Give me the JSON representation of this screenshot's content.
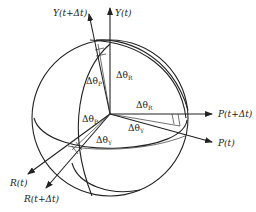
{
  "diagram": {
    "type": "rotation-sphere",
    "axes": {
      "y_t": "Y(t)",
      "y_t_dt": "Y(t+Δt)",
      "p_t": "P(t)",
      "p_t_dt": "P(t+Δt)",
      "r_t": "R(t)",
      "r_t_dt": "R(t+Δt)"
    },
    "angles": {
      "top_left": "Δθ",
      "top_left_sub": "P",
      "top_right": "Δθ",
      "top_right_sub": "R",
      "right_upper": "Δθ",
      "right_upper_sub": "R",
      "right_lower": "Δθ",
      "right_lower_sub": "Y",
      "left_upper": "Δθ",
      "left_upper_sub": "P",
      "left_lower": "Δθ",
      "left_lower_sub": "Y"
    },
    "colors": {
      "line": "#222222",
      "background": "#ffffff"
    }
  }
}
